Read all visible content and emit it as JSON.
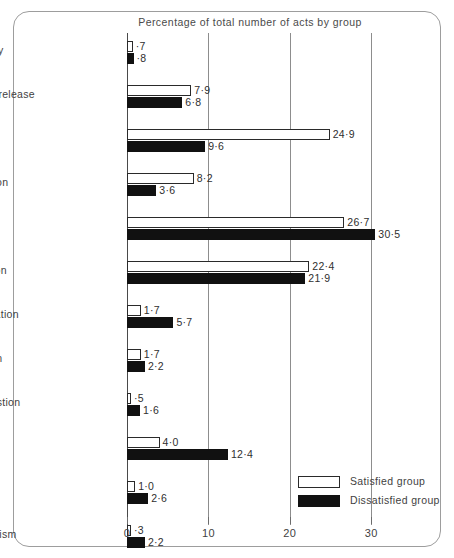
{
  "chart_data": {
    "type": "bar",
    "orientation": "horizontal",
    "title": "Percentage of total number of acts by group",
    "xlabel": "",
    "ylabel": "",
    "xlim": [
      0,
      38.7
    ],
    "xticks": [
      0,
      10,
      20,
      30
    ],
    "xtick_labels": [
      "0",
      "10",
      "20",
      "30"
    ],
    "grid": "vertical",
    "legend_position": "bottom-right",
    "categories": [
      "Shows solidarity",
      "Shows tension release",
      "Agrees",
      "Gives suggestion",
      "Gives opinion",
      "Gives orientation",
      "Asks for orientation",
      "Asks for opinion",
      "Asks for suggestion",
      "Disagrees",
      "Shows tension",
      "Shows antagonism"
    ],
    "series": [
      {
        "name": "Satisfied group",
        "fill": "#ffffff",
        "edge": "#2a2a2a",
        "values": [
          0.7,
          7.9,
          24.9,
          8.2,
          26.7,
          22.4,
          1.7,
          1.7,
          0.5,
          4.0,
          1.0,
          0.3
        ],
        "value_labels": [
          "·7",
          "7·9",
          "24·9",
          "8·2",
          "26·7",
          "22·4",
          "1·7",
          "1·7",
          "·5",
          "4·0",
          "1·0",
          "·3"
        ]
      },
      {
        "name": "Dissatisfied group",
        "fill": "#111111",
        "edge": "#111111",
        "values": [
          0.8,
          6.8,
          9.6,
          3.6,
          30.5,
          21.9,
          5.7,
          2.2,
          1.6,
          12.4,
          2.6,
          2.2
        ],
        "value_labels": [
          "·8",
          "6·8",
          "9·6",
          "3·6",
          "30·5",
          "21·9",
          "5·7",
          "2·2",
          "1·6",
          "12·4",
          "2·6",
          "2·2"
        ]
      }
    ]
  },
  "legend": {
    "items": [
      {
        "label": "Satisfied group",
        "swatch": "sat"
      },
      {
        "label": "Dissatisfied group",
        "swatch": "dis"
      }
    ]
  }
}
